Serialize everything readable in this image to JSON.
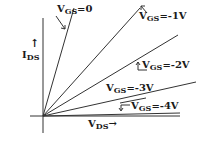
{
  "diagram": {
    "y_axis": {
      "label_main": "I",
      "label_sub": "DS",
      "arrow": "↑"
    },
    "x_axis": {
      "label_main": "V",
      "label_sub": "DS",
      "arrow": "→"
    },
    "curves": [
      {
        "label_main": "V",
        "label_sub": "GS",
        "value": "=0"
      },
      {
        "label_main": "V",
        "label_sub": "GS",
        "value": "=-1V"
      },
      {
        "label_main": "V",
        "label_sub": "GS",
        "value": "=-2V"
      },
      {
        "label_main": "V",
        "label_sub": "GS",
        "value": "=-3V"
      },
      {
        "label_main": "V",
        "label_sub": "GS",
        "value": "=-4V"
      }
    ],
    "colors": {
      "line": "#333333",
      "text": "#1a1a1a"
    }
  }
}
